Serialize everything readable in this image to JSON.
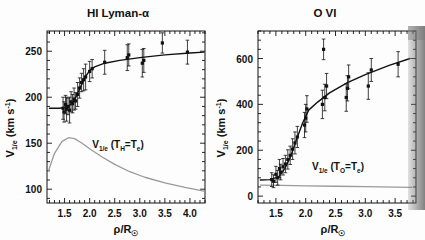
{
  "figure": {
    "background": "#fdfdfd",
    "ink": "#111111",
    "model_curve_color": "#9a9a9a"
  },
  "panels": [
    {
      "id": "hi-lyman-alpha",
      "title": "HI Lyman-α",
      "inline_label": "V",
      "inline_label_sub": "1/e",
      "inline_label_paren": "(T",
      "inline_label_paren_sub": "H",
      "inline_label_paren_eq": "=T",
      "inline_label_paren_sub2": "e",
      "inline_label_paren_close": ")",
      "ylabel_main": "V",
      "ylabel_sub": "1/e",
      "ylabel_unit": "(km s",
      "ylabel_exp": "-1",
      "ylabel_unit_close": ")",
      "xlabel_main": "ρ/R",
      "xlabel_sub": "☉",
      "yticks": [
        100,
        150,
        200,
        250
      ],
      "ylim": [
        85,
        272
      ],
      "xticks": [
        1.5,
        2.0,
        2.5,
        3.0,
        3.5,
        4.0
      ],
      "xlim": [
        1.15,
        4.3
      ]
    },
    {
      "id": "o-vi",
      "title": "O VI",
      "inline_label": "V",
      "inline_label_sub": "1/e",
      "inline_label_paren": "(T",
      "inline_label_paren_sub": "O",
      "inline_label_paren_eq": "=T",
      "inline_label_paren_sub2": "e",
      "inline_label_paren_close": ")",
      "ylabel_main": "V",
      "ylabel_sub": "1/e",
      "ylabel_unit": "(km s",
      "ylabel_exp": "-1",
      "ylabel_unit_close": ")",
      "xlabel_main": "ρ/R",
      "xlabel_sub": "☉",
      "yticks": [
        0,
        200,
        400,
        600
      ],
      "ylim": [
        -30,
        720
      ],
      "xticks": [
        1.5,
        2.0,
        2.5,
        3.0,
        3.5
      ],
      "xlim": [
        1.2,
        3.85
      ]
    }
  ],
  "chart_data": [
    {
      "type": "scatter",
      "panel": "HI Lyman-α",
      "title": "HI Lyman-α",
      "xlabel": "ρ/R☉",
      "ylabel": "V1/e (km s-1)",
      "xlim": [
        1.15,
        4.3
      ],
      "ylim": [
        85,
        272
      ],
      "xticks": [
        1.5,
        2.0,
        2.5,
        3.0,
        3.5,
        4.0
      ],
      "yticks": [
        100,
        150,
        200,
        250
      ],
      "grid": false,
      "legend": "none",
      "annotations": [
        "V1/e (TH=Te)"
      ],
      "series": [
        {
          "name": "observed V1/e",
          "marker": "filled-square-with-errorbars",
          "points": [
            {
              "x": 1.47,
              "y": 188,
              "yerr": 12
            },
            {
              "x": 1.49,
              "y": 184,
              "yerr": 11
            },
            {
              "x": 1.52,
              "y": 192,
              "yerr": 10
            },
            {
              "x": 1.54,
              "y": 187,
              "yerr": 13
            },
            {
              "x": 1.57,
              "y": 190,
              "yerr": 9
            },
            {
              "x": 1.6,
              "y": 186,
              "yerr": 14
            },
            {
              "x": 1.63,
              "y": 195,
              "yerr": 11
            },
            {
              "x": 1.66,
              "y": 193,
              "yerr": 10
            },
            {
              "x": 1.69,
              "y": 198,
              "yerr": 12
            },
            {
              "x": 1.72,
              "y": 196,
              "yerr": 9
            },
            {
              "x": 1.76,
              "y": 203,
              "yerr": 13
            },
            {
              "x": 1.8,
              "y": 210,
              "yerr": 11
            },
            {
              "x": 1.84,
              "y": 216,
              "yerr": 10
            },
            {
              "x": 1.88,
              "y": 219,
              "yerr": 12
            },
            {
              "x": 1.92,
              "y": 222,
              "yerr": 14
            },
            {
              "x": 2.0,
              "y": 228,
              "yerr": 11
            },
            {
              "x": 2.05,
              "y": 231,
              "yerr": 10
            },
            {
              "x": 2.3,
              "y": 238,
              "yerr": 13
            },
            {
              "x": 2.75,
              "y": 243,
              "yerr": 14
            },
            {
              "x": 2.78,
              "y": 246,
              "yerr": 12
            },
            {
              "x": 3.05,
              "y": 237,
              "yerr": 15
            },
            {
              "x": 3.08,
              "y": 240,
              "yerr": 13
            },
            {
              "x": 3.45,
              "y": 259,
              "yerr": 11
            },
            {
              "x": 3.95,
              "y": 249,
              "yerr": 13
            }
          ]
        },
        {
          "name": "fit curve",
          "type": "line",
          "style": "solid",
          "x": [
            1.2,
            1.4,
            1.5,
            1.6,
            1.7,
            1.8,
            1.9,
            2.0,
            2.1,
            2.3,
            2.6,
            3.0,
            3.5,
            4.0,
            4.28
          ],
          "y": [
            188,
            188,
            189,
            191,
            197,
            209,
            221,
            229,
            233,
            237,
            240,
            243,
            246,
            248,
            249
          ]
        },
        {
          "name": "V1/e (TH=Te) model",
          "type": "line",
          "style": "thin-gray",
          "x": [
            1.18,
            1.3,
            1.45,
            1.58,
            1.7,
            1.85,
            2.0,
            2.25,
            2.5,
            2.8,
            3.1,
            3.5,
            3.9,
            4.28
          ],
          "y": [
            120,
            139,
            152,
            156,
            155,
            150,
            144,
            135,
            127,
            119,
            113,
            107,
            102,
            98
          ]
        }
      ]
    },
    {
      "type": "scatter",
      "panel": "O VI",
      "title": "O VI",
      "xlabel": "ρ/R☉",
      "ylabel": "V1/e (km s-1)",
      "xlim": [
        1.2,
        3.85
      ],
      "ylim": [
        -30,
        720
      ],
      "xticks": [
        1.5,
        2.0,
        2.5,
        3.0,
        3.5
      ],
      "yticks": [
        0,
        200,
        400,
        600
      ],
      "grid": false,
      "legend": "none",
      "annotations": [
        "V1/e (TO=Te)"
      ],
      "series": [
        {
          "name": "observed V1/e",
          "marker": "filled-square-with-errorbars",
          "points": [
            {
              "x": 1.43,
              "y": 72,
              "yerr": 30
            },
            {
              "x": 1.46,
              "y": 65,
              "yerr": 28
            },
            {
              "x": 1.5,
              "y": 95,
              "yerr": 35
            },
            {
              "x": 1.53,
              "y": 80,
              "yerr": 32
            },
            {
              "x": 1.56,
              "y": 120,
              "yerr": 40
            },
            {
              "x": 1.58,
              "y": 105,
              "yerr": 34
            },
            {
              "x": 1.62,
              "y": 128,
              "yerr": 36
            },
            {
              "x": 1.66,
              "y": 140,
              "yerr": 38
            },
            {
              "x": 1.7,
              "y": 160,
              "yerr": 42
            },
            {
              "x": 1.74,
              "y": 178,
              "yerr": 40
            },
            {
              "x": 1.78,
              "y": 205,
              "yerr": 45
            },
            {
              "x": 1.82,
              "y": 232,
              "yerr": 48
            },
            {
              "x": 1.86,
              "y": 258,
              "yerr": 46
            },
            {
              "x": 1.98,
              "y": 310,
              "yerr": 55
            },
            {
              "x": 2.0,
              "y": 340,
              "yerr": 60
            },
            {
              "x": 2.02,
              "y": 380,
              "yerr": 58
            },
            {
              "x": 2.28,
              "y": 400,
              "yerr": 62
            },
            {
              "x": 2.32,
              "y": 430,
              "yerr": 58
            },
            {
              "x": 2.35,
              "y": 480,
              "yerr": 55
            },
            {
              "x": 2.3,
              "y": 640,
              "yerr": 45
            },
            {
              "x": 2.68,
              "y": 430,
              "yerr": 60
            },
            {
              "x": 2.7,
              "y": 470,
              "yerr": 55
            },
            {
              "x": 2.72,
              "y": 520,
              "yerr": 52
            },
            {
              "x": 3.05,
              "y": 480,
              "yerr": 58
            },
            {
              "x": 3.1,
              "y": 550,
              "yerr": 50
            },
            {
              "x": 3.55,
              "y": 575,
              "yerr": 55
            }
          ]
        },
        {
          "name": "fit curve",
          "type": "line",
          "style": "solid",
          "x": [
            1.24,
            1.4,
            1.55,
            1.65,
            1.75,
            1.85,
            1.95,
            2.05,
            2.2,
            2.4,
            2.7,
            3.0,
            3.4,
            3.75
          ],
          "y": [
            70,
            72,
            85,
            120,
            175,
            250,
            320,
            375,
            410,
            450,
            495,
            530,
            570,
            600
          ]
        },
        {
          "name": "V1/e (TO=Te) model",
          "type": "line",
          "style": "thin-gray",
          "x": [
            1.24,
            1.6,
            2.0,
            2.5,
            3.0,
            3.5,
            3.78
          ],
          "y": [
            48,
            47,
            45,
            43,
            41,
            39,
            38
          ]
        }
      ]
    }
  ]
}
